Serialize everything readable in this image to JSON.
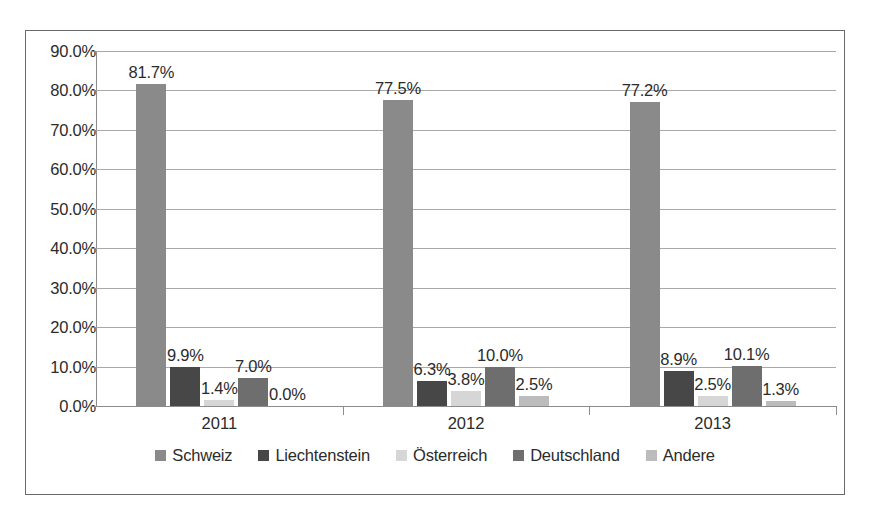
{
  "chart_data": {
    "type": "bar",
    "title": "",
    "xlabel": "",
    "ylabel": "",
    "categories": [
      "2011",
      "2012",
      "2013"
    ],
    "ylim": [
      0,
      90
    ],
    "y_ticks": [
      "0.0%",
      "10.0%",
      "20.0%",
      "30.0%",
      "40.0%",
      "50.0%",
      "60.0%",
      "70.0%",
      "80.0%",
      "90.0%"
    ],
    "y_tick_values": [
      0,
      10,
      20,
      30,
      40,
      50,
      60,
      70,
      80,
      90
    ],
    "grid": true,
    "legend_position": "bottom",
    "value_suffix": "%",
    "series": [
      {
        "name": "Schweiz",
        "color": "#8a8a8a",
        "values": [
          81.7,
          77.5,
          77.2
        ],
        "labels": [
          "81.7%",
          "77.5%",
          "77.2%"
        ]
      },
      {
        "name": "Liechtenstein",
        "color": "#474747",
        "values": [
          9.9,
          6.3,
          8.9
        ],
        "labels": [
          "9.9%",
          "6.3%",
          "8.9%"
        ]
      },
      {
        "name": "Österreich",
        "color": "#d6d6d6",
        "values": [
          1.4,
          3.8,
          2.5
        ],
        "labels": [
          "1.4%",
          "3.8%",
          "2.5%"
        ]
      },
      {
        "name": "Deutschland",
        "color": "#6e6e6e",
        "values": [
          7.0,
          10.0,
          10.1
        ],
        "labels": [
          "7.0%",
          "10.0%",
          "10.1%"
        ]
      },
      {
        "name": "Andere",
        "color": "#bcbcbc",
        "values": [
          0.0,
          2.5,
          1.3
        ],
        "labels": [
          "0.0%",
          "2.5%",
          "1.3%"
        ]
      }
    ]
  },
  "colors": {
    "frame_border": "#6a6a6a",
    "gridline": "#a8a8a8",
    "axis_line": "#8c8c8c",
    "text": "#2b2b2b",
    "background": "#ffffff"
  }
}
